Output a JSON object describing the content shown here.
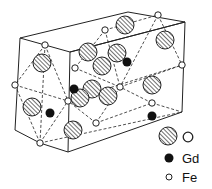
{
  "diagram": {
    "type": "crystal-structure",
    "colors": {
      "line": "#222222",
      "atom_fill_dark": "#111111",
      "atom_fill_light": "#ffffff",
      "background": "#ffffff"
    },
    "box": {
      "solid_edges": [
        [
          20,
          38,
          128,
          12
        ],
        [
          128,
          12,
          185,
          22
        ],
        [
          185,
          22,
          70,
          52
        ],
        [
          70,
          52,
          20,
          38
        ],
        [
          20,
          38,
          15,
          130
        ],
        [
          15,
          130,
          40,
          143
        ],
        [
          40,
          143,
          68,
          152
        ],
        [
          70,
          52,
          68,
          152
        ],
        [
          185,
          22,
          182,
          112
        ],
        [
          182,
          112,
          68,
          152
        ],
        [
          70,
          52,
          185,
          22
        ]
      ],
      "dashed_edges": [
        [
          15,
          85,
          68,
          101
        ],
        [
          68,
          101,
          182,
          65
        ],
        [
          40,
          143,
          182,
          112
        ],
        [
          45,
          45,
          40,
          143
        ],
        [
          45,
          45,
          15,
          85
        ],
        [
          45,
          45,
          68,
          101
        ],
        [
          15,
          85,
          40,
          143
        ],
        [
          40,
          143,
          68,
          101
        ],
        [
          105,
          30,
          75,
          68
        ],
        [
          105,
          30,
          158,
          15
        ],
        [
          158,
          15,
          182,
          65
        ],
        [
          75,
          68,
          120,
          87
        ],
        [
          120,
          87,
          182,
          65
        ],
        [
          120,
          87,
          96,
          123
        ],
        [
          96,
          123,
          152,
          103
        ],
        [
          152,
          103,
          182,
          112
        ],
        [
          152,
          103,
          120,
          87
        ],
        [
          96,
          123,
          68,
          101
        ],
        [
          158,
          15,
          120,
          87
        ],
        [
          105,
          30,
          120,
          87
        ]
      ]
    },
    "atoms": {
      "O": [
        [
          42,
          63
        ],
        [
          32,
          107
        ],
        [
          73,
          130
        ],
        [
          125,
          25
        ],
        [
          165,
          40
        ],
        [
          88,
          52
        ],
        [
          102,
          66
        ],
        [
          117,
          53
        ],
        [
          92,
          89
        ],
        [
          80,
          98
        ],
        [
          108,
          96
        ],
        [
          152,
          85
        ]
      ],
      "Gd": [
        [
          127,
          62
        ],
        [
          74,
          89
        ],
        [
          50,
          113
        ],
        [
          152,
          116
        ]
      ],
      "Fe": [
        [
          45,
          45
        ],
        [
          15,
          85
        ],
        [
          68,
          101
        ],
        [
          40,
          143
        ],
        [
          105,
          30
        ],
        [
          158,
          15
        ],
        [
          182,
          65
        ],
        [
          75,
          68
        ],
        [
          120,
          87
        ],
        [
          96,
          123
        ],
        [
          152,
          103
        ]
      ]
    },
    "radii": {
      "O": 9,
      "Gd": 4.5,
      "Fe": 3.2
    }
  },
  "legend": {
    "items": [
      {
        "symbol": "O",
        "label": "O"
      },
      {
        "symbol": "Gd",
        "label": "Gd"
      },
      {
        "symbol": "Fe",
        "label": "Fe"
      }
    ]
  }
}
